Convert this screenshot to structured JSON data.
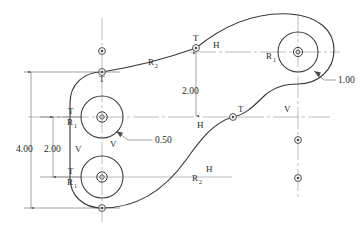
{
  "figure": {
    "kind": "engineering-drawing",
    "caption": "",
    "colors": {
      "outline": "#3a3a3a",
      "centerline": "#6d6d6d",
      "dimension": "#5a5a5a",
      "text": "#2a2a2a",
      "background": "#ffffff"
    }
  },
  "dimensions": [
    {
      "id": "overall-height",
      "value": "4.00"
    },
    {
      "id": "boss-spacing",
      "value": "2.00"
    },
    {
      "id": "offset-vertical",
      "value": "2.00"
    },
    {
      "id": "hole-radius",
      "value": "0.50"
    },
    {
      "id": "fillet-radius",
      "value": "1.00"
    }
  ],
  "radius_labels": {
    "r1": "R",
    "r1_sub": "1",
    "r2": "R",
    "r2_sub": "2"
  },
  "markers": {
    "tangent": "T",
    "horizontal": "H",
    "vertical": "V"
  },
  "annotations": [
    {
      "id": "t-upper-left-boss",
      "text": "T"
    },
    {
      "id": "r1-upper-left-boss",
      "text": "R"
    },
    {
      "id": "t-lower-left-boss",
      "text": "T"
    },
    {
      "id": "r1-lower-left-boss",
      "text": "R"
    },
    {
      "id": "t-upper-curve",
      "text": "T"
    },
    {
      "id": "h-upper-curve",
      "text": "H"
    },
    {
      "id": "t-mid-right",
      "text": "T"
    },
    {
      "id": "v-mid-right",
      "text": "V"
    },
    {
      "id": "h-mid-center",
      "text": "H"
    },
    {
      "id": "h-lower-curve",
      "text": "H"
    },
    {
      "id": "v-left-column",
      "text": "V"
    },
    {
      "id": "v-under-boss",
      "text": "V"
    },
    {
      "id": "t-top-left-outline",
      "text": "T"
    },
    {
      "id": "r1-right-boss",
      "text": "R"
    },
    {
      "id": "r2-upper-curve",
      "text": "R"
    },
    {
      "id": "r2-lower-curve",
      "text": "R"
    }
  ]
}
